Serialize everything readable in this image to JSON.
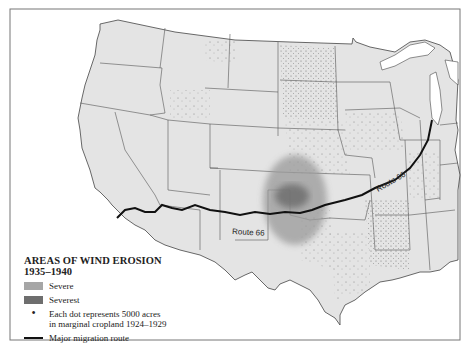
{
  "map": {
    "route_label_1": "Route 66",
    "route_label_2": "Route 66",
    "colors": {
      "land": "#e4e4e4",
      "border": "#555555",
      "severe": "#9a9a9a",
      "severest": "#6e6e6e",
      "route": "#111111",
      "water": "#ffffff"
    }
  },
  "legend": {
    "title_line1": "AREAS OF WIND EROSION",
    "title_line2": "1935–1940",
    "items": [
      {
        "label": "Severe"
      },
      {
        "label": "Severest"
      },
      {
        "label_line1": "Each dot represents 5000 acres",
        "label_line2": "in marginal cropland 1924–1929"
      },
      {
        "label": "Major migration route"
      }
    ]
  }
}
